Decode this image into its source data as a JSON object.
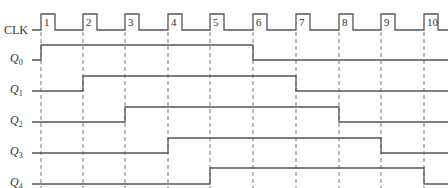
{
  "diagram": {
    "clock": {
      "label": "CLK",
      "pulse_numbers": [
        "1",
        "2",
        "3",
        "4",
        "5",
        "6",
        "7",
        "8",
        "9",
        "10"
      ],
      "rising_edges_x": [
        41,
        83,
        125,
        168,
        210,
        253,
        296,
        339,
        381,
        424
      ],
      "pulse_width": 14,
      "high_y": 14,
      "low_y": 30
    },
    "signals": [
      {
        "name": "Q",
        "sub": "0",
        "high_y": 45,
        "low_y": 60,
        "start_x": 32,
        "rise_at_edge": 1,
        "fall_at_edge": 6
      },
      {
        "name": "Q",
        "sub": "1",
        "high_y": 76,
        "low_y": 91,
        "start_x": 32,
        "rise_at_edge": 2,
        "fall_at_edge": 7
      },
      {
        "name": "Q",
        "sub": "2",
        "high_y": 107,
        "low_y": 122,
        "start_x": 32,
        "rise_at_edge": 3,
        "fall_at_edge": 8
      },
      {
        "name": "Q",
        "sub": "3",
        "high_y": 138,
        "low_y": 153,
        "start_x": 32,
        "rise_at_edge": 4,
        "fall_at_edge": 9
      },
      {
        "name": "Q",
        "sub": "4",
        "high_y": 168,
        "low_y": 184,
        "start_x": 32,
        "rise_at_edge": 5,
        "fall_at_edge": 10
      }
    ],
    "colors": {
      "line": "#555555",
      "text": "#333333",
      "background": "#ffffff"
    }
  }
}
